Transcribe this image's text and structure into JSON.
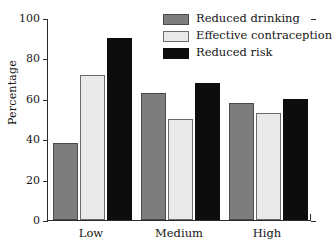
{
  "chart_data": {
    "type": "bar",
    "title": "",
    "xlabel": "",
    "ylabel": "Percentage",
    "ylim": [
      0,
      100
    ],
    "yticks": [
      0,
      20,
      40,
      60,
      80,
      100
    ],
    "ytick_labels": [
      "0",
      "20",
      "40",
      "60",
      "80",
      "100"
    ],
    "grid": false,
    "legend_position": "top-right",
    "categories": [
      "Low",
      "Medium",
      "High"
    ],
    "series": [
      {
        "name": "Reduced drinking",
        "color": "#7d7d7d",
        "values": [
          38,
          63,
          58
        ]
      },
      {
        "name": "Effective contraception",
        "color": "#e9e9e9",
        "values": [
          72,
          50,
          53
        ]
      },
      {
        "name": "Reduced risk",
        "color": "#0d0d0d",
        "values": [
          90,
          68,
          60
        ]
      }
    ]
  },
  "legend": {
    "items": [
      {
        "label": "Reduced drinking"
      },
      {
        "label": "Effective contraception"
      },
      {
        "label": "Reduced risk"
      }
    ]
  },
  "axes": {
    "y_title": "Percentage",
    "y_tick_labels": [
      "100",
      "80",
      "60",
      "40",
      "20",
      "0"
    ],
    "x_tick_labels": [
      "Low",
      "Medium",
      "High"
    ]
  }
}
